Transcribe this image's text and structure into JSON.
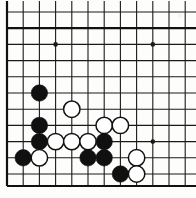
{
  "board": {
    "title": "Go board position diagram",
    "game": "Go",
    "visible_columns": 12,
    "visible_rows": 11,
    "cell_size": 16.2,
    "origin_x": 7,
    "origin_y": 12,
    "line_color": "#1a1a1a",
    "border_color": "#111111",
    "background_color": "#fdfdfc",
    "black_stone_color": "#101010",
    "white_stone_color": "#ffffff",
    "white_stone_outline": "#111111",
    "line_width": 1.1,
    "border_width": 2.2,
    "stone_radius": 8.2
  },
  "star_points": [
    {
      "col": 3,
      "row": 2,
      "name": "hoshi-upper-left"
    },
    {
      "col": 9,
      "row": 2,
      "name": "hoshi-upper-right"
    },
    {
      "col": 9,
      "row": 8,
      "name": "hoshi-lower-right"
    }
  ],
  "stones": [
    {
      "col": 2,
      "row": 5,
      "color": "black",
      "label": "black-stone-c2r5"
    },
    {
      "col": 2,
      "row": 7,
      "color": "black",
      "label": "black-stone-c2r7"
    },
    {
      "col": 2,
      "row": 8,
      "color": "black",
      "label": "black-stone-c2r8"
    },
    {
      "col": 1,
      "row": 9,
      "color": "black",
      "label": "black-stone-c1r9"
    },
    {
      "col": 2,
      "row": 9,
      "color": "white",
      "label": "white-stone-c2r9"
    },
    {
      "col": 3,
      "row": 8,
      "color": "white",
      "label": "white-stone-c3r8"
    },
    {
      "col": 4,
      "row": 8,
      "color": "white",
      "label": "white-stone-c4r8"
    },
    {
      "col": 4,
      "row": 6,
      "color": "white",
      "label": "white-stone-c4r6"
    },
    {
      "col": 5,
      "row": 8,
      "color": "white",
      "label": "white-stone-c5r8"
    },
    {
      "col": 6,
      "row": 8,
      "color": "black",
      "label": "black-stone-c6r8"
    },
    {
      "col": 6,
      "row": 7,
      "color": "white",
      "label": "white-stone-c6r7"
    },
    {
      "col": 7,
      "row": 7,
      "color": "white",
      "label": "white-stone-c7r7"
    },
    {
      "col": 5,
      "row": 9,
      "color": "black",
      "label": "black-stone-c5r9"
    },
    {
      "col": 6,
      "row": 9,
      "color": "black",
      "label": "black-stone-c6r9"
    },
    {
      "col": 8,
      "row": 9,
      "color": "white",
      "label": "white-stone-c8r9"
    },
    {
      "col": 7,
      "row": 10,
      "color": "black",
      "label": "black-stone-c7r10"
    },
    {
      "col": 8,
      "row": 10,
      "color": "white",
      "label": "white-stone-c8r10"
    }
  ],
  "counts": {
    "black_stones": 8,
    "white_stones": 9,
    "total_stones": 17
  }
}
